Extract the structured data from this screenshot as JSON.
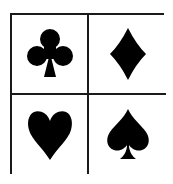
{
  "colors": {
    "border": "#1a1a1a",
    "suit_fill": "#000000",
    "background": "#ffffff"
  },
  "cells": [
    {
      "suit": "club",
      "icon": "club-icon",
      "glyph": "♣"
    },
    {
      "suit": "diamond",
      "icon": "diamond-icon",
      "glyph": "♦"
    },
    {
      "suit": "heart",
      "icon": "heart-icon",
      "glyph": "♥"
    },
    {
      "suit": "spade",
      "icon": "spade-icon",
      "glyph": "♠"
    }
  ]
}
